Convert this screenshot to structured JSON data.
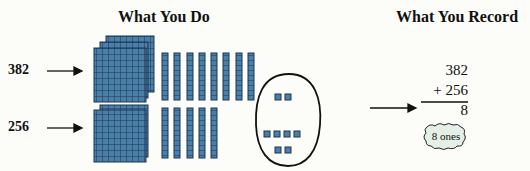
{
  "left_panel": {
    "title": "What You Do",
    "rows": [
      {
        "label": "382",
        "hundreds": 3,
        "tens": 8
      },
      {
        "label": "256",
        "hundreds": 2,
        "tens": 5
      }
    ],
    "ones_group": {
      "top": 2,
      "middle": 4,
      "bottom": 2,
      "total": 8
    }
  },
  "right_panel": {
    "title": "What You Record",
    "addend1": "382",
    "addend2": "+ 256",
    "result": "8",
    "cloud_note": "8 ones"
  },
  "colors": {
    "block_fill": "#4a7fa8",
    "block_grid": "#1c3550",
    "background": "#fcfcf8",
    "cloud_fill": "#e4efe6"
  }
}
